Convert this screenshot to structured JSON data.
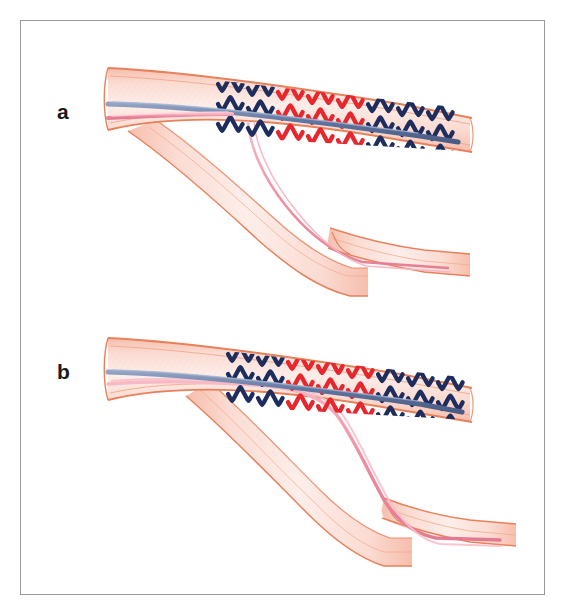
{
  "figure": {
    "kind": "medical-illustration",
    "border_color": "#9a9a9a",
    "background_color": "#ffffff",
    "panels": [
      {
        "id": "a",
        "label": "a",
        "caption_visible": false,
        "description": "Stent deployed across the side-branch ostium in the main vessel; blue guidewire in the main vessel, pink guidewire lying alongside it proximal to the stent; a thin pink wire runs down inside the side branch.",
        "stent": {
          "rows": 3,
          "columns": 8,
          "segment_colors": [
            "#1c2d5e",
            "#1c2d5e",
            "#e8262e",
            "#e8262e",
            "#e8262e",
            "#1c2d5e",
            "#1c2d5e",
            "#1c2d5e"
          ],
          "navy_color": "#1c2d5e",
          "red_color": "#e8262e"
        },
        "wires": [
          {
            "name": "main-vessel-guidewire",
            "color": "#6b7fa8",
            "route": "main-vessel"
          },
          {
            "name": "side-branch-guidewire",
            "color": "#f08ca0",
            "route": "side-branch"
          }
        ]
      },
      {
        "id": "b",
        "label": "b",
        "caption_visible": false,
        "description": "Stent re-positioned more distally; the pink guidewire is rewired through the stent struts and passes into the side branch, while the blue guidewire continues down the main vessel.",
        "stent": {
          "rows": 3,
          "columns": 8,
          "segment_colors": [
            "#1c2d5e",
            "#1c2d5e",
            "#e8262e",
            "#e8262e",
            "#e8262e",
            "#1c2d5e",
            "#1c2d5e",
            "#1c2d5e"
          ],
          "navy_color": "#1c2d5e",
          "red_color": "#e8262e"
        },
        "wires": [
          {
            "name": "main-vessel-guidewire",
            "color": "#6b7fa8",
            "route": "main-vessel"
          },
          {
            "name": "side-branch-guidewire",
            "color": "#f08ca0",
            "route": "through-struts-into-side-branch"
          }
        ]
      }
    ],
    "colors": {
      "vessel_wall_outline": "#e8805a",
      "vessel_wall_inner_line": "#f2a98c",
      "vessel_lumen_light": "#fbe2dc",
      "vessel_lumen_mid": "#f7c9bd",
      "stent_navy": "#1c2d5e",
      "stent_red": "#e8262e",
      "guidewire_blue": "#6b7fa8",
      "guidewire_pink": "#f08ca0",
      "frame_border": "#9a9a9a",
      "label_text": "#1a1a1a"
    }
  }
}
